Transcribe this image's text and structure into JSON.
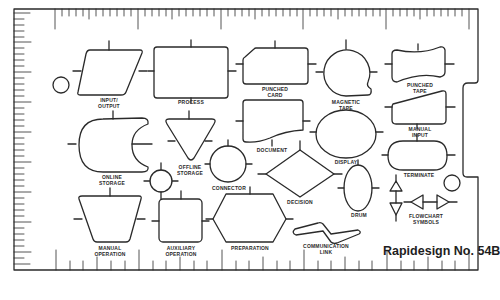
{
  "template": {
    "brand": "Rapidesign No. 54B",
    "colors": {
      "ink": "#2a2a2a",
      "background": "#ffffff"
    }
  },
  "shapes": [
    {
      "id": "input-output",
      "label_line1": "INPUT/",
      "label_line2": "OUTPUT"
    },
    {
      "id": "process",
      "label_line1": "PROCESS",
      "label_line2": ""
    },
    {
      "id": "punched-card",
      "label_line1": "PUNCHED",
      "label_line2": "CARD"
    },
    {
      "id": "magnetic-tape",
      "label_line1": "MAGNETIC",
      "label_line2": "TAPE"
    },
    {
      "id": "punched-tape",
      "label_line1": "PUNCHED",
      "label_line2": "TAPE"
    },
    {
      "id": "online-storage",
      "label_line1": "ONLINE",
      "label_line2": "STORAGE"
    },
    {
      "id": "offline-storage",
      "label_line1": "OFFLINE",
      "label_line2": "STORAGE"
    },
    {
      "id": "connector",
      "label_line1": "CONNECTOR",
      "label_line2": ""
    },
    {
      "id": "document",
      "label_line1": "DOCUMENT",
      "label_line2": ""
    },
    {
      "id": "display",
      "label_line1": "DISPLAY",
      "label_line2": ""
    },
    {
      "id": "manual-input",
      "label_line1": "MANUAL",
      "label_line2": "INPUT"
    },
    {
      "id": "decision",
      "label_line1": "DECISION",
      "label_line2": ""
    },
    {
      "id": "drum",
      "label_line1": "DRUM",
      "label_line2": ""
    },
    {
      "id": "terminate",
      "label_line1": "TERMINATE",
      "label_line2": ""
    },
    {
      "id": "flowchart-symbols",
      "label_line1": "FLOWCHART",
      "label_line2": "SYMBOLS"
    },
    {
      "id": "manual-operation",
      "label_line1": "MANUAL",
      "label_line2": "OPERATION"
    },
    {
      "id": "auxiliary-operation",
      "label_line1": "AUXILIARY",
      "label_line2": "OPERATION"
    },
    {
      "id": "preparation",
      "label_line1": "PREPARATION",
      "label_line2": ""
    },
    {
      "id": "communication-link",
      "label_line1": "COMMUNICATION",
      "label_line2": "LINK"
    }
  ]
}
